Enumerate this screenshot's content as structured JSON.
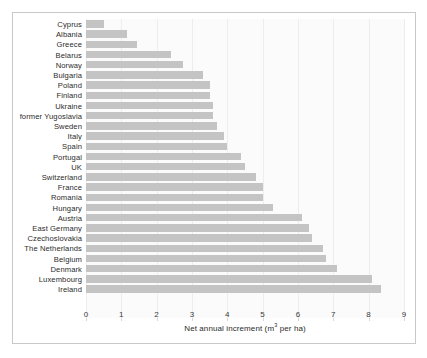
{
  "chart_data": {
    "type": "bar",
    "orientation": "horizontal",
    "title": "",
    "xlabel": "Net annual increment (m3 per ha)",
    "xlabel_parts": {
      "before": "Net annual increment (m",
      "sup": "3",
      "after": " per ha)"
    },
    "ylabel": "",
    "xlim": [
      0,
      9
    ],
    "xticks": [
      0,
      1,
      2,
      3,
      4,
      5,
      6,
      7,
      8,
      9
    ],
    "xtick_labels": [
      "0",
      "1",
      "2",
      "3",
      "4",
      "5",
      "6",
      "7",
      "8",
      "9"
    ],
    "grid": true,
    "grid_axis": "x",
    "legend": false,
    "bar_color": "#c4c4c4",
    "plot_background": "#fbfbfb",
    "frame_color": "#c9c9c9",
    "categories": [
      "Cyprus",
      "Albania",
      "Greece",
      "Belarus",
      "Norway",
      "Bulgaria",
      "Poland",
      "Finland",
      "Ukraine",
      "former Yugoslavia",
      "Sweden",
      "Italy",
      "Spain",
      "Portugal",
      "UK",
      "Switzerland",
      "France",
      "Romania",
      "Hungary",
      "Austria",
      "East Germany",
      "Czechoslovakia",
      "The Netherlands",
      "Belgium",
      "Denmark",
      "Luxembourg",
      "Ireland"
    ],
    "values": [
      0.5,
      1.15,
      1.45,
      2.4,
      2.75,
      3.3,
      3.5,
      3.5,
      3.6,
      3.6,
      3.7,
      3.9,
      4.0,
      4.4,
      4.5,
      4.8,
      5.0,
      5.0,
      5.3,
      6.1,
      6.3,
      6.4,
      6.7,
      6.8,
      7.1,
      8.1,
      8.35
    ]
  }
}
